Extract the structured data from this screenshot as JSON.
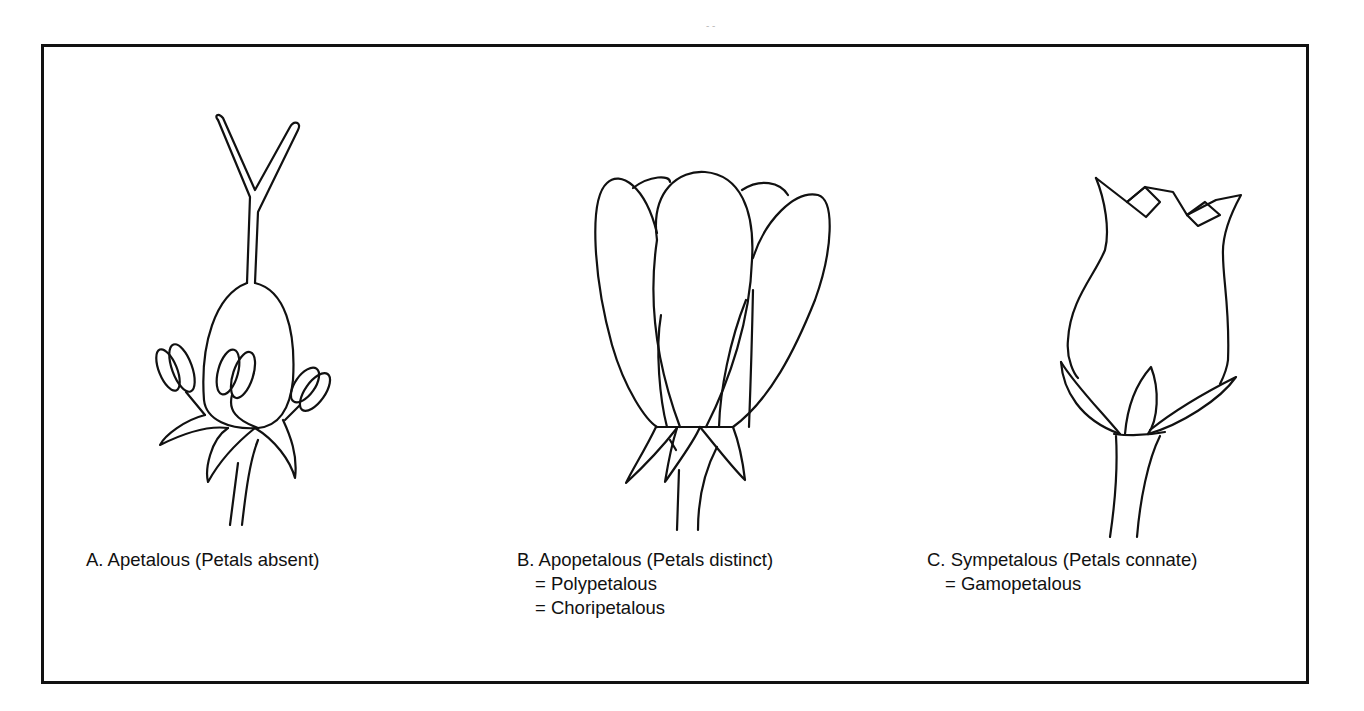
{
  "figure": {
    "panels": [
      {
        "id": "A",
        "illustration": "apetalous-flower",
        "caption_lines": [
          "A. Apetalous (Petals absent)"
        ]
      },
      {
        "id": "B",
        "illustration": "apopetalous-flower",
        "caption_lines": [
          "B. Apopetalous (Petals distinct)",
          "= Polypetalous",
          "= Choripetalous"
        ]
      },
      {
        "id": "C",
        "illustration": "sympetalous-flower",
        "caption_lines": [
          "C. Sympetalous (Petals connate)",
          "= Gamopetalous"
        ]
      }
    ],
    "colors": {
      "line": "#111111",
      "background": "#ffffff"
    }
  }
}
